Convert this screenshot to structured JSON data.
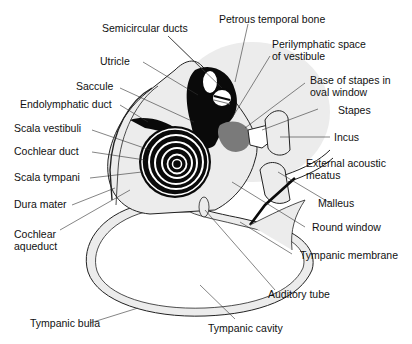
{
  "diagram": {
    "type": "anatomical-illustration",
    "colors": {
      "background": "#ffffff",
      "bone_fill": "#ececec",
      "halo_fill": "#e9e9e9",
      "dark": "#0a0a0a",
      "grey_mid": "#7a7a7a",
      "line": "#222222"
    },
    "labels": {
      "semicircular_ducts": "Semicircular ducts",
      "petrous_temporal_bone": "Petrous temporal bone",
      "perilymphatic_space_1": "Perilymphatic space",
      "perilymphatic_space_2": "of vestibule",
      "utricle": "Utricle",
      "base_of_stapes_1": "Base of stapes in",
      "base_of_stapes_2": "oval window",
      "saccule": "Saccule",
      "endolymphatic_duct": "Endolymphatic duct",
      "stapes": "Stapes",
      "scala_vestibuli": "Scala vestibuli",
      "incus": "Incus",
      "cochlear_duct": "Cochlear duct",
      "external_acoustic_1": "External acoustic",
      "external_acoustic_2": "meatus",
      "scala_tympani": "Scala tympani",
      "malleus": "Malleus",
      "dura_mater": "Dura mater",
      "round_window": "Round window",
      "cochlear_aqueduct_1": "Cochlear",
      "cochlear_aqueduct_2": "aqueduct",
      "tympanic_membrane": "Tympanic membrane",
      "auditory_tube": "Auditory tube",
      "tympanic_bulla": "Tympanic bulla",
      "tympanic_cavity": "Tympanic cavity"
    }
  }
}
